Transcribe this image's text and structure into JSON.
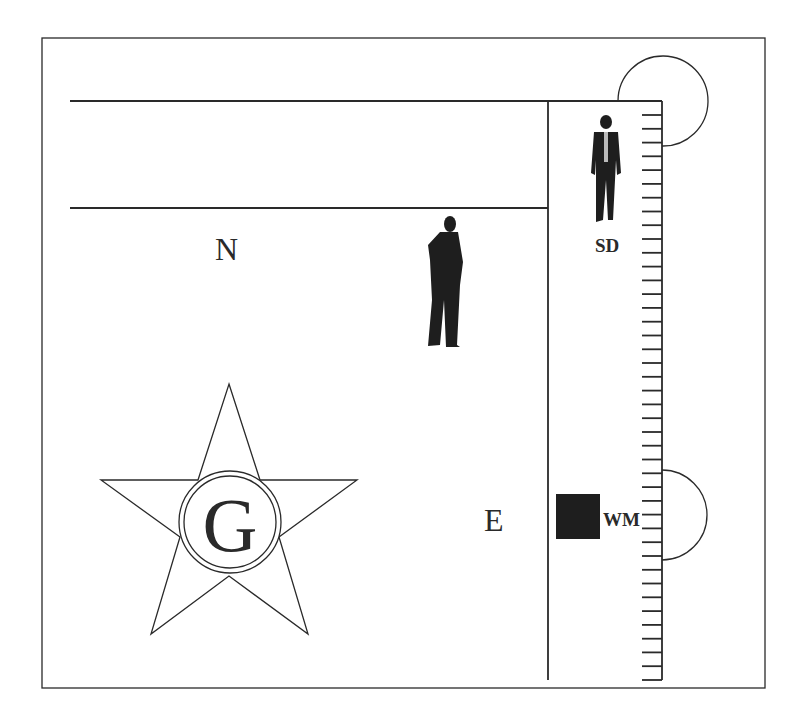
{
  "diagram": {
    "labels": {
      "north": "N",
      "east": "E",
      "sd": "SD",
      "wm": "WM",
      "emblem_letter": "G"
    },
    "figures": [
      {
        "name": "standing-man-suit",
        "position": "upper-right corridor"
      },
      {
        "name": "standing-man-side",
        "position": "center"
      }
    ],
    "ruler": {
      "tick_count": 42
    },
    "colors": {
      "line": "#2a2a2a",
      "fill": "#1e1e1e",
      "background": "#ffffff"
    }
  }
}
